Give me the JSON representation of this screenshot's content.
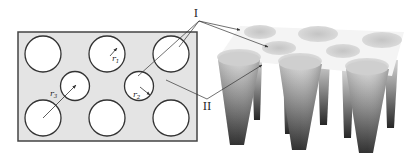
{
  "diagram": {
    "type": "schematic",
    "left_panel": {
      "name": "top-view",
      "plate_color": "#e4e4e4",
      "border_color": "#444444",
      "holes": [
        {
          "cx": 43,
          "cy": 54,
          "r": 18,
          "kind": "large"
        },
        {
          "cx": 107,
          "cy": 54,
          "r": 18,
          "kind": "large"
        },
        {
          "cx": 171,
          "cy": 54,
          "r": 18,
          "kind": "large"
        },
        {
          "cx": 75,
          "cy": 86,
          "r": 14.5,
          "kind": "small"
        },
        {
          "cx": 139,
          "cy": 86,
          "r": 14.5,
          "kind": "small"
        },
        {
          "cx": 43,
          "cy": 118,
          "r": 18,
          "kind": "large"
        },
        {
          "cx": 107,
          "cy": 118,
          "r": 18,
          "kind": "large"
        },
        {
          "cx": 171,
          "cy": 118,
          "r": 18,
          "kind": "large"
        }
      ],
      "labels": {
        "r1": "r",
        "r1_sub": "1",
        "r2": "r",
        "r2_sub": "2",
        "r3": "r",
        "r3_sub": "3"
      }
    },
    "callouts": {
      "label_I": "I",
      "label_II": "II"
    },
    "right_panel": {
      "name": "3d-cone-array",
      "top_color": "#f6f6f6",
      "cone_top_color": "#d0d0d0",
      "cone_bottom_color": "#2a2a2a"
    }
  }
}
